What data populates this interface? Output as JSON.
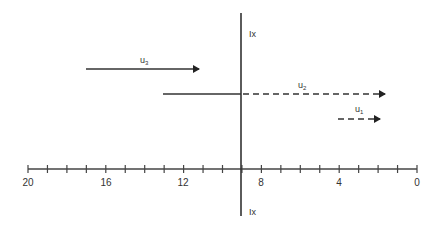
{
  "diagram": {
    "axis": {
      "ticks_major_labels": [
        "20",
        "16",
        "12",
        "8",
        "4",
        "0"
      ],
      "range": [
        20,
        0
      ],
      "tick_count": 21,
      "color": "#333333"
    },
    "vertical_line": {
      "position_value": 9,
      "label_top": "Ix",
      "label_bottom": "Ix"
    },
    "vectors": [
      {
        "name": "u3",
        "label": "u",
        "subscript": "3",
        "style": "solid",
        "from": 17,
        "to": 11.2
      },
      {
        "name": "u2",
        "label": "u",
        "subscript": "2",
        "style": "solid-then-dashed",
        "from": 13.1,
        "break_at": 9,
        "to": 1.6
      },
      {
        "name": "u1",
        "label": "u",
        "subscript": "1",
        "style": "dashed",
        "from": 4,
        "to": 1.9
      }
    ]
  }
}
